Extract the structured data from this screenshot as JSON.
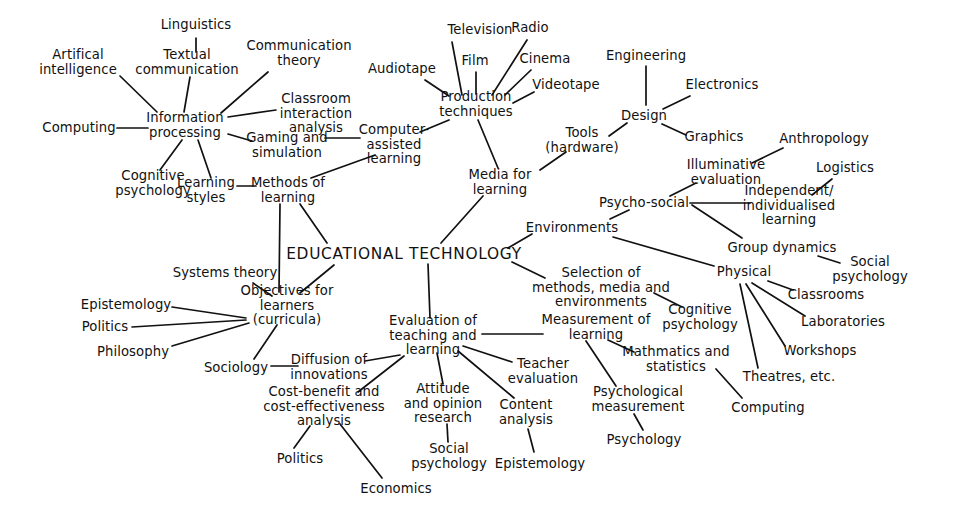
{
  "diagram": {
    "kind": "concept-map",
    "title": "EDUCATIONAL TECHNOLOGY",
    "ink_color": "#111111",
    "background_color": "#ffffff",
    "width": 960,
    "height": 522,
    "nodes": [
      {
        "id": "artificial_intelligence",
        "label": "Artifical\nintelligence",
        "x": 78,
        "y": 62
      },
      {
        "id": "linguistics",
        "label": "Linguistics",
        "x": 196,
        "y": 25
      },
      {
        "id": "textual_communication",
        "label": "Textual\ncommunication",
        "x": 187,
        "y": 62
      },
      {
        "id": "communication_theory",
        "label": "Communication\ntheory",
        "x": 299,
        "y": 53
      },
      {
        "id": "computing_left",
        "label": "Computing",
        "x": 79,
        "y": 128
      },
      {
        "id": "information_processing",
        "label": "Information\nprocessing",
        "x": 185,
        "y": 125
      },
      {
        "id": "classroom_interaction_analysis",
        "label": "Classroom\ninteraction\nanalysis",
        "x": 316,
        "y": 114
      },
      {
        "id": "gaming_and_simulation",
        "label": "Gaming and\nsimulation",
        "x": 287,
        "y": 145
      },
      {
        "id": "cognitive_psychology_left",
        "label": "Cognitive\npsychology",
        "x": 153,
        "y": 183
      },
      {
        "id": "learning_styles",
        "label": "Learning\nstyles",
        "x": 206,
        "y": 190
      },
      {
        "id": "methods_of_learning",
        "label": "Methods of\nlearning",
        "x": 288,
        "y": 190
      },
      {
        "id": "computer_assisted_learning",
        "label": "Computer-\nassisted\nlearning",
        "x": 394,
        "y": 145
      },
      {
        "id": "audiotape",
        "label": "Audiotape",
        "x": 402,
        "y": 69
      },
      {
        "id": "television",
        "label": "Television",
        "x": 480,
        "y": 30
      },
      {
        "id": "film",
        "label": "Film",
        "x": 475,
        "y": 61
      },
      {
        "id": "radio",
        "label": "Radio",
        "x": 530,
        "y": 28
      },
      {
        "id": "cinema",
        "label": "Cinema",
        "x": 545,
        "y": 59
      },
      {
        "id": "videotape",
        "label": "Videotape",
        "x": 566,
        "y": 85
      },
      {
        "id": "production_techniques",
        "label": "Production\ntechniques",
        "x": 476,
        "y": 104
      },
      {
        "id": "media_for_learning",
        "label": "Media for\nlearning",
        "x": 500,
        "y": 182
      },
      {
        "id": "engineering",
        "label": "Engineering",
        "x": 646,
        "y": 56
      },
      {
        "id": "design",
        "label": "Design",
        "x": 644,
        "y": 116
      },
      {
        "id": "electronics",
        "label": "Electronics",
        "x": 722,
        "y": 85
      },
      {
        "id": "graphics",
        "label": "Graphics",
        "x": 714,
        "y": 137
      },
      {
        "id": "tools_hardware",
        "label": "Tools\n(hardware)",
        "x": 582,
        "y": 140
      },
      {
        "id": "anthropology",
        "label": "Anthropology",
        "x": 824,
        "y": 139
      },
      {
        "id": "illuminative_evaluation",
        "label": "Illuminative\nevaluation",
        "x": 726,
        "y": 172
      },
      {
        "id": "logistics",
        "label": "Logistics",
        "x": 845,
        "y": 168
      },
      {
        "id": "psycho_social",
        "label": "Psycho-social",
        "x": 644,
        "y": 203
      },
      {
        "id": "independent_individualised_learning",
        "label": "Independent/\nindividualised\nlearning",
        "x": 789,
        "y": 206
      },
      {
        "id": "environments",
        "label": "Environments",
        "x": 572,
        "y": 228
      },
      {
        "id": "group_dynamics",
        "label": "Group dynamics",
        "x": 782,
        "y": 248
      },
      {
        "id": "social_psychology_right",
        "label": "Social\npsychology",
        "x": 870,
        "y": 269
      },
      {
        "id": "physical",
        "label": "Physical",
        "x": 744,
        "y": 272
      },
      {
        "id": "classrooms",
        "label": "Classrooms",
        "x": 826,
        "y": 295
      },
      {
        "id": "laboratories",
        "label": "Laboratories",
        "x": 843,
        "y": 322
      },
      {
        "id": "workshops",
        "label": "Workshops",
        "x": 820,
        "y": 351
      },
      {
        "id": "theatres_etc",
        "label": "Theatres, etc.",
        "x": 789,
        "y": 377
      },
      {
        "id": "computing_right",
        "label": "Computing",
        "x": 768,
        "y": 408
      },
      {
        "id": "educational_technology",
        "label": "EDUCATIONAL TECHNOLOGY",
        "x": 404,
        "y": 254
      },
      {
        "id": "selection_methods_media_environments",
        "label": "Selection of\nmethods, media and\nenvironments",
        "x": 601,
        "y": 288
      },
      {
        "id": "cognitive_psychology_right",
        "label": "Cognitive\npsychology",
        "x": 700,
        "y": 317
      },
      {
        "id": "measurement_of_learning",
        "label": "Measurement of\nlearning",
        "x": 596,
        "y": 327
      },
      {
        "id": "mathmatics_and_statistics",
        "label": "Mathmatics and\nstatistics",
        "x": 676,
        "y": 359
      },
      {
        "id": "psychological_measurement",
        "label": "Psychological\nmeasurement",
        "x": 638,
        "y": 399
      },
      {
        "id": "psychology",
        "label": "Psychology",
        "x": 644,
        "y": 440
      },
      {
        "id": "systems_theory",
        "label": "Systems theory",
        "x": 225,
        "y": 273
      },
      {
        "id": "objectives_for_learners",
        "label": "Objectives for\nlearners\n(curricula)",
        "x": 287,
        "y": 306
      },
      {
        "id": "epistemology_left",
        "label": "Epistemology",
        "x": 126,
        "y": 305
      },
      {
        "id": "politics_left",
        "label": "Politics",
        "x": 105,
        "y": 327
      },
      {
        "id": "philosophy",
        "label": "Philosophy",
        "x": 133,
        "y": 352
      },
      {
        "id": "sociology",
        "label": "Sociology",
        "x": 236,
        "y": 368
      },
      {
        "id": "diffusion_of_innovations",
        "label": "Diffusion of\ninnovations",
        "x": 329,
        "y": 367
      },
      {
        "id": "cost_benefit_analysis",
        "label": "Cost-benefit and\ncost-effectiveness\nanalysis",
        "x": 324,
        "y": 407
      },
      {
        "id": "politics_bottom",
        "label": "Politics",
        "x": 300,
        "y": 459
      },
      {
        "id": "economics",
        "label": "Economics",
        "x": 396,
        "y": 489
      },
      {
        "id": "evaluation_of_teaching_and_learning",
        "label": "Evaluation of\nteaching and\nlearning",
        "x": 433,
        "y": 336
      },
      {
        "id": "attitude_and_opinion_research",
        "label": "Attitude\nand opinion\nresearch",
        "x": 443,
        "y": 404
      },
      {
        "id": "social_psychology_bottom",
        "label": "Social\npsychology",
        "x": 449,
        "y": 456
      },
      {
        "id": "content_analysis",
        "label": "Content\nanalysis",
        "x": 526,
        "y": 412
      },
      {
        "id": "epistemology_bottom",
        "label": "Epistemology",
        "x": 540,
        "y": 464
      },
      {
        "id": "teacher_evaluation",
        "label": "Teacher\nevaluation",
        "x": 543,
        "y": 371
      }
    ],
    "edges": [
      {
        "from": "artificial_intelligence",
        "to": "information_processing",
        "x1": 120,
        "y1": 76,
        "x2": 157,
        "y2": 112
      },
      {
        "from": "linguistics",
        "to": "textual_communication",
        "x1": 196,
        "y1": 38,
        "x2": 196,
        "y2": 52
      },
      {
        "from": "textual_communication",
        "to": "information_processing",
        "x1": 190,
        "y1": 77,
        "x2": 184,
        "y2": 112
      },
      {
        "from": "communication_theory",
        "to": "information_processing",
        "x1": 268,
        "y1": 72,
        "x2": 221,
        "y2": 113
      },
      {
        "from": "computing_left",
        "to": "information_processing",
        "x1": 117,
        "y1": 128,
        "x2": 148,
        "y2": 128
      },
      {
        "from": "information_processing",
        "to": "classroom_interaction_analysis",
        "x1": 228,
        "y1": 117,
        "x2": 276,
        "y2": 110
      },
      {
        "from": "information_processing",
        "to": "gaming_and_simulation",
        "x1": 228,
        "y1": 134,
        "x2": 252,
        "y2": 141
      },
      {
        "from": "information_processing",
        "to": "cognitive_psychology_left",
        "x1": 182,
        "y1": 140,
        "x2": 160,
        "y2": 170
      },
      {
        "from": "information_processing",
        "to": "learning_styles",
        "x1": 198,
        "y1": 140,
        "x2": 211,
        "y2": 178
      },
      {
        "from": "learning_styles",
        "to": "methods_of_learning",
        "x1": 237,
        "y1": 186,
        "x2": 256,
        "y2": 186
      },
      {
        "from": "gaming_and_simulation",
        "to": "computer_assisted_learning",
        "x1": 325,
        "y1": 138,
        "x2": 360,
        "y2": 138
      },
      {
        "from": "computer_assisted_learning",
        "to": "methods_of_learning",
        "x1": 375,
        "y1": 155,
        "x2": 311,
        "y2": 178
      },
      {
        "from": "methods_of_learning",
        "to": "educational_technology",
        "x1": 300,
        "y1": 204,
        "x2": 327,
        "y2": 243
      },
      {
        "from": "methods_of_learning",
        "to": "objectives_for_learners",
        "x1": 280,
        "y1": 204,
        "x2": 279,
        "y2": 292
      },
      {
        "from": "audiotape",
        "to": "production_techniques",
        "x1": 425,
        "y1": 80,
        "x2": 449,
        "y2": 96
      },
      {
        "from": "television",
        "to": "production_techniques",
        "x1": 452,
        "y1": 42,
        "x2": 462,
        "y2": 95
      },
      {
        "from": "film",
        "to": "production_techniques",
        "x1": 476,
        "y1": 72,
        "x2": 476,
        "y2": 94
      },
      {
        "from": "radio",
        "to": "production_techniques",
        "x1": 527,
        "y1": 40,
        "x2": 492,
        "y2": 95
      },
      {
        "from": "cinema",
        "to": "production_techniques",
        "x1": 531,
        "y1": 70,
        "x2": 505,
        "y2": 95
      },
      {
        "from": "videotape",
        "to": "production_techniques",
        "x1": 534,
        "y1": 92,
        "x2": 513,
        "y2": 103
      },
      {
        "from": "production_techniques",
        "to": "computer_assisted_learning",
        "x1": 449,
        "y1": 120,
        "x2": 420,
        "y2": 132
      },
      {
        "from": "production_techniques",
        "to": "media_for_learning",
        "x1": 478,
        "y1": 120,
        "x2": 498,
        "y2": 168
      },
      {
        "from": "media_for_learning",
        "to": "educational_technology",
        "x1": 483,
        "y1": 196,
        "x2": 441,
        "y2": 243
      },
      {
        "from": "engineering",
        "to": "design",
        "x1": 646,
        "y1": 66,
        "x2": 646,
        "y2": 105
      },
      {
        "from": "electronics",
        "to": "design",
        "x1": 690,
        "y1": 96,
        "x2": 663,
        "y2": 109
      },
      {
        "from": "design",
        "to": "graphics",
        "x1": 662,
        "y1": 124,
        "x2": 686,
        "y2": 135
      },
      {
        "from": "tools_hardware",
        "to": "design",
        "x1": 609,
        "y1": 136,
        "x2": 627,
        "y2": 123
      },
      {
        "from": "tools_hardware",
        "to": "media_for_learning",
        "x1": 566,
        "y1": 152,
        "x2": 540,
        "y2": 170
      },
      {
        "from": "illuminative_evaluation",
        "to": "anthropology",
        "x1": 752,
        "y1": 163,
        "x2": 783,
        "y2": 148
      },
      {
        "from": "psycho_social",
        "to": "illuminative_evaluation",
        "x1": 670,
        "y1": 196,
        "x2": 696,
        "y2": 183
      },
      {
        "from": "psycho_social",
        "to": "independent_individualised_learning",
        "x1": 690,
        "y1": 203,
        "x2": 750,
        "y2": 203
      },
      {
        "from": "psycho_social",
        "to": "group_dynamics",
        "x1": 692,
        "y1": 205,
        "x2": 742,
        "y2": 238
      },
      {
        "from": "independent_individualised_learning",
        "to": "logistics",
        "x1": 812,
        "y1": 195,
        "x2": 832,
        "y2": 179
      },
      {
        "from": "environments",
        "to": "psycho_social",
        "x1": 610,
        "y1": 219,
        "x2": 629,
        "y2": 210
      },
      {
        "from": "environments",
        "to": "physical",
        "x1": 613,
        "y1": 237,
        "x2": 714,
        "y2": 266
      },
      {
        "from": "environments",
        "to": "educational_technology",
        "x1": 532,
        "y1": 234,
        "x2": 508,
        "y2": 248
      },
      {
        "from": "group_dynamics",
        "to": "social_psychology_right",
        "x1": 818,
        "y1": 256,
        "x2": 840,
        "y2": 263
      },
      {
        "from": "physical",
        "to": "classrooms",
        "x1": 768,
        "y1": 281,
        "x2": 793,
        "y2": 290
      },
      {
        "from": "physical",
        "to": "laboratories",
        "x1": 752,
        "y1": 283,
        "x2": 805,
        "y2": 316
      },
      {
        "from": "physical",
        "to": "workshops",
        "x1": 746,
        "y1": 284,
        "x2": 785,
        "y2": 346
      },
      {
        "from": "physical",
        "to": "theatres_etc",
        "x1": 740,
        "y1": 284,
        "x2": 758,
        "y2": 368
      },
      {
        "from": "educational_technology",
        "to": "selection_methods_media_environments",
        "x1": 512,
        "y1": 262,
        "x2": 545,
        "y2": 278
      },
      {
        "from": "selection_methods_media_environments",
        "to": "cognitive_psychology_right",
        "x1": 654,
        "y1": 293,
        "x2": 682,
        "y2": 307
      },
      {
        "from": "measurement_of_learning",
        "to": "evaluation_of_teaching_and_learning",
        "x1": 543,
        "y1": 334,
        "x2": 482,
        "y2": 334
      },
      {
        "from": "measurement_of_learning",
        "to": "mathmatics_and_statistics",
        "x1": 608,
        "y1": 340,
        "x2": 634,
        "y2": 352
      },
      {
        "from": "measurement_of_learning",
        "to": "psychological_measurement",
        "x1": 586,
        "y1": 341,
        "x2": 616,
        "y2": 386
      },
      {
        "from": "psychological_measurement",
        "to": "psychology",
        "x1": 634,
        "y1": 414,
        "x2": 643,
        "y2": 430
      },
      {
        "from": "mathmatics_and_statistics",
        "to": "computing_right",
        "x1": 716,
        "y1": 369,
        "x2": 742,
        "y2": 398
      },
      {
        "from": "educational_technology",
        "to": "evaluation_of_teaching_and_learning",
        "x1": 428,
        "y1": 264,
        "x2": 430,
        "y2": 318
      },
      {
        "from": "educational_technology",
        "to": "objectives_for_learners",
        "x1": 334,
        "y1": 265,
        "x2": 300,
        "y2": 293
      },
      {
        "from": "systems_theory",
        "to": "objectives_for_learners",
        "x1": 253,
        "y1": 283,
        "x2": 272,
        "y2": 296
      },
      {
        "from": "epistemology_left",
        "to": "objectives_for_learners",
        "x1": 172,
        "y1": 307,
        "x2": 246,
        "y2": 318
      },
      {
        "from": "politics_left",
        "to": "objectives_for_learners",
        "x1": 132,
        "y1": 327,
        "x2": 246,
        "y2": 320
      },
      {
        "from": "philosophy",
        "to": "objectives_for_learners",
        "x1": 172,
        "y1": 346,
        "x2": 249,
        "y2": 323
      },
      {
        "from": "sociology",
        "to": "objectives_for_learners",
        "x1": 254,
        "y1": 359,
        "x2": 277,
        "y2": 325
      },
      {
        "from": "sociology",
        "to": "diffusion_of_innovations",
        "x1": 271,
        "y1": 366,
        "x2": 298,
        "y2": 366
      },
      {
        "from": "diffusion_of_innovations",
        "to": "evaluation_of_teaching_and_learning",
        "x1": 365,
        "y1": 361,
        "x2": 400,
        "y2": 355
      },
      {
        "from": "cost_benefit_analysis",
        "to": "evaluation_of_teaching_and_learning",
        "x1": 358,
        "y1": 392,
        "x2": 404,
        "y2": 356
      },
      {
        "from": "cost_benefit_analysis",
        "to": "politics_bottom",
        "x1": 310,
        "y1": 426,
        "x2": 294,
        "y2": 448
      },
      {
        "from": "cost_benefit_analysis",
        "to": "economics",
        "x1": 340,
        "y1": 424,
        "x2": 382,
        "y2": 478
      },
      {
        "from": "evaluation_of_teaching_and_learning",
        "to": "attitude_and_opinion_research",
        "x1": 437,
        "y1": 353,
        "x2": 443,
        "y2": 384
      },
      {
        "from": "attitude_and_opinion_research",
        "to": "social_psychology_bottom",
        "x1": 447,
        "y1": 424,
        "x2": 448,
        "y2": 442
      },
      {
        "from": "evaluation_of_teaching_and_learning",
        "to": "content_analysis",
        "x1": 458,
        "y1": 351,
        "x2": 514,
        "y2": 398
      },
      {
        "from": "content_analysis",
        "to": "epistemology_bottom",
        "x1": 528,
        "y1": 429,
        "x2": 534,
        "y2": 452
      },
      {
        "from": "evaluation_of_teaching_and_learning",
        "to": "teacher_evaluation",
        "x1": 463,
        "y1": 346,
        "x2": 512,
        "y2": 362
      }
    ]
  }
}
